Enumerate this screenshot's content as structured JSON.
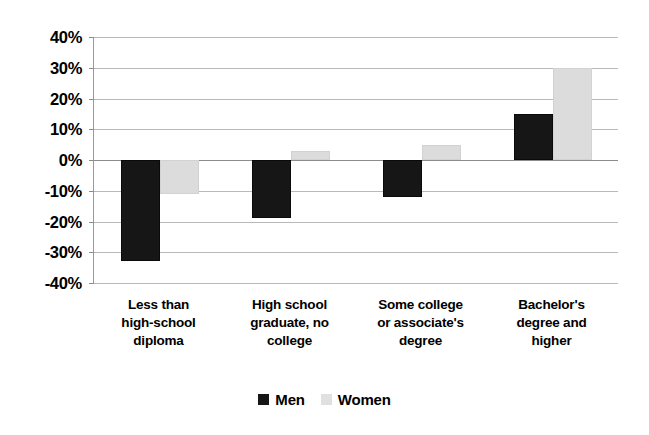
{
  "chart_data": {
    "type": "bar",
    "title": "",
    "subtitle": "",
    "xlabel": "",
    "ylabel": "",
    "ylim": [
      -40,
      40
    ],
    "ytick_step": 10,
    "ytick_labels": [
      "40%",
      "30%",
      "20%",
      "10%",
      "0%",
      "-10%",
      "-20%",
      "-30%",
      "-40%"
    ],
    "ytick_values": [
      40,
      30,
      20,
      10,
      0,
      -10,
      -20,
      -30,
      -40
    ],
    "grid": true,
    "legend_position": "bottom",
    "value_format": "percent",
    "categories": [
      "Less than high-school diploma",
      "High school graduate, no college",
      "Some college or associate's degree",
      "Bachelor's degree and higher"
    ],
    "category_label_lines": [
      [
        "Less than",
        "high-school",
        "diploma"
      ],
      [
        "High school",
        "graduate, no",
        "college"
      ],
      [
        "Some college",
        "or associate's",
        "degree"
      ],
      [
        "Bachelor's",
        "degree and",
        "higher"
      ]
    ],
    "series": [
      {
        "name": "Men",
        "color": "#161616",
        "values": [
          -33,
          -19,
          -12,
          15
        ]
      },
      {
        "name": "Women",
        "color": "#dcdcdc",
        "values": [
          -11,
          3,
          5,
          30
        ]
      }
    ]
  },
  "legend": {
    "items": [
      {
        "label": "Men",
        "swatch": "men-swatch"
      },
      {
        "label": "Women",
        "swatch": "women-swatch"
      }
    ]
  }
}
